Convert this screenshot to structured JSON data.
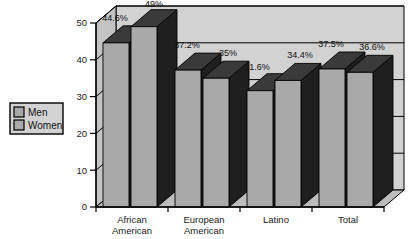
{
  "chart_data": {
    "type": "bar",
    "title": "",
    "subtitle": "",
    "xlabel": "",
    "ylabel": "",
    "ylim": [
      0,
      50
    ],
    "yticks": [
      0,
      10,
      20,
      30,
      40,
      50
    ],
    "ytick_labels": [
      "0",
      "10",
      "20",
      "30",
      "40",
      "50"
    ],
    "grid": true,
    "legend_position": "left-outside",
    "three_d": true,
    "categories": [
      "African American",
      "European American",
      "Latino",
      "Total"
    ],
    "category_lines": [
      [
        "African",
        "American"
      ],
      [
        "European",
        "American"
      ],
      [
        "Latino",
        ""
      ],
      [
        "Total",
        ""
      ]
    ],
    "series": [
      {
        "name": "Men",
        "values": [
          44.6,
          37.2,
          31.6,
          37.5
        ],
        "labels": [
          "44.6%",
          "37.2%",
          "31.6%",
          "37.5%"
        ],
        "color": "#a9a9a9"
      },
      {
        "name": "Women",
        "values": [
          49.0,
          35.0,
          34.4,
          36.6
        ],
        "labels": [
          "49%",
          "35%",
          "34.4%",
          "36.6%"
        ],
        "color": "#a9a9a9"
      }
    ]
  },
  "legend": {
    "items": [
      {
        "label": "Men",
        "swatch_color": "#a9a9a9"
      },
      {
        "label": "Women",
        "swatch_color": "#a9a9a9"
      }
    ]
  },
  "colors": {
    "bar_front": "#a9a9a9",
    "bar_top": "#3a3a3a",
    "bar_side": "#1f1f1f",
    "wall_back": "#d2d2d2",
    "wall_side": "#c4c4c4",
    "floor": "#bdbdbd",
    "outline": "#000000",
    "text": "#111111",
    "page_background": "#ffffff"
  }
}
